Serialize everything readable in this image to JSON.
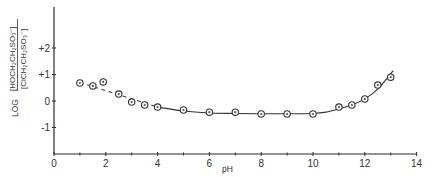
{
  "chart_data": {
    "type": "scatter",
    "title": "",
    "xlabel": "pH",
    "ylabel": "LOG [HOCH2CH2SO3-]/[ClCH2CH2SO3-]",
    "ylabel_prefix": "LOG",
    "ylabel_numerator": "[HOCH₂CH₂SO₃⁻]",
    "ylabel_denominator": "[ClCH₂CH₂SO₃⁻]",
    "xlim": [
      0,
      14
    ],
    "ylim": [
      -2,
      3
    ],
    "x_ticks": [
      0,
      2,
      4,
      6,
      8,
      10,
      12,
      14
    ],
    "x_tick_labels": [
      "0",
      "2",
      "4",
      "6",
      "8",
      "10",
      "12",
      "14"
    ],
    "x_minor_ticks": [
      1,
      3,
      5,
      7,
      9,
      11,
      13
    ],
    "y_ticks": [
      2,
      1,
      0,
      -1
    ],
    "y_tick_labels": [
      "+2",
      "+1",
      "0",
      "-1"
    ],
    "grid": false,
    "legend": null,
    "series": [
      {
        "name": "measured",
        "style": "open circles",
        "x": [
          1.0,
          1.5,
          1.9,
          2.5,
          3.0,
          3.5,
          4.0,
          5.0,
          6.0,
          7.0,
          8.0,
          9.0,
          10.0,
          11.0,
          11.5,
          12.0,
          12.5,
          13.0
        ],
        "y": [
          0.68,
          0.57,
          0.72,
          0.26,
          -0.04,
          -0.15,
          -0.23,
          -0.34,
          -0.42,
          -0.42,
          -0.49,
          -0.49,
          -0.49,
          -0.23,
          -0.15,
          0.08,
          0.6,
          0.9
        ]
      },
      {
        "name": "extrapolated fit (dashed)",
        "style": "dashed line",
        "x": [
          1.0,
          4.0
        ],
        "y": [
          0.7,
          -0.23
        ]
      },
      {
        "name": "theoretical fit (solid)",
        "style": "solid line",
        "x": [
          4.0,
          5.0,
          6.0,
          7.0,
          8.0,
          9.0,
          10.0,
          10.5,
          11.0,
          11.5,
          12.0,
          12.5,
          13.1
        ],
        "y": [
          -0.23,
          -0.38,
          -0.45,
          -0.47,
          -0.48,
          -0.48,
          -0.47,
          -0.42,
          -0.3,
          -0.15,
          0.08,
          0.45,
          1.15
        ]
      }
    ]
  }
}
